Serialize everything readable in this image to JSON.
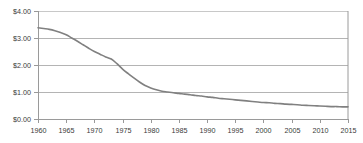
{
  "chart_data": {
    "type": "line",
    "title": "",
    "subtitle": "",
    "xlabel": "",
    "ylabel": "",
    "grid": true,
    "legend": false,
    "legend_position": "none",
    "xlim": [
      1960,
      2015
    ],
    "ylim": [
      0.0,
      4.0
    ],
    "y_tick_values": [
      0.0,
      1.0,
      2.0,
      3.0,
      4.0
    ],
    "y_tick_labels": [
      "$0.00",
      "$1.00",
      "$2.00",
      "$3.00",
      "$4.00"
    ],
    "x_tick_values": [
      1960,
      1965,
      1970,
      1975,
      1980,
      1985,
      1990,
      1995,
      2000,
      2005,
      2010,
      2015
    ],
    "x_tick_labels": [
      "1960",
      "1965",
      "1970",
      "1975",
      "1980",
      "1985",
      "1990",
      "1995",
      "2000",
      "2005",
      "2010",
      "2015"
    ],
    "series": [
      {
        "name": "value",
        "color": "#808080",
        "x": [
          1960,
          1961,
          1962,
          1963,
          1964,
          1965,
          1966,
          1967,
          1968,
          1969,
          1970,
          1971,
          1972,
          1973,
          1974,
          1975,
          1976,
          1977,
          1978,
          1979,
          1980,
          1981,
          1982,
          1983,
          1984,
          1985,
          1986,
          1987,
          1988,
          1989,
          1990,
          1991,
          1992,
          1993,
          1994,
          1995,
          1996,
          1997,
          1998,
          1999,
          2000,
          2001,
          2002,
          2003,
          2004,
          2005,
          2006,
          2007,
          2008,
          2009,
          2010,
          2011,
          2012,
          2013,
          2014,
          2015
        ],
        "y": [
          3.38,
          3.35,
          3.32,
          3.27,
          3.2,
          3.12,
          3.0,
          2.88,
          2.75,
          2.62,
          2.5,
          2.4,
          2.3,
          2.22,
          2.05,
          1.85,
          1.68,
          1.52,
          1.37,
          1.24,
          1.15,
          1.08,
          1.03,
          1.0,
          0.97,
          0.95,
          0.92,
          0.9,
          0.87,
          0.85,
          0.82,
          0.8,
          0.77,
          0.75,
          0.73,
          0.71,
          0.69,
          0.67,
          0.65,
          0.63,
          0.61,
          0.6,
          0.58,
          0.57,
          0.55,
          0.54,
          0.53,
          0.51,
          0.5,
          0.49,
          0.48,
          0.47,
          0.46,
          0.46,
          0.45,
          0.45
        ]
      }
    ]
  },
  "style": {
    "line_color": "#808080",
    "grid_color": "#b4b4b4",
    "axis_color": "#999999",
    "frame_color": "#9a9a9a",
    "label_color": "#3a3a3a",
    "background": "#ffffff"
  }
}
